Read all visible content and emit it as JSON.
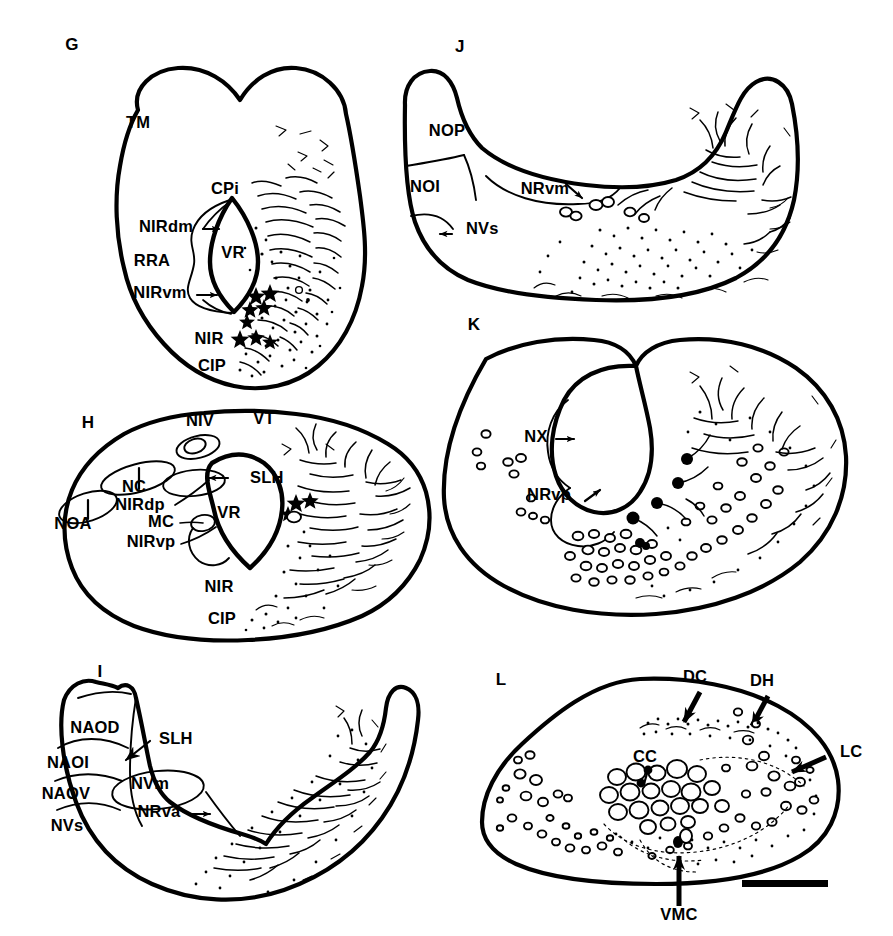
{
  "figure": {
    "background_color": "#ffffff",
    "ink_color": "#000000",
    "panel_letters": [
      "G",
      "H",
      "I",
      "J",
      "K",
      "L"
    ]
  },
  "panels": [
    {
      "letter": "G",
      "column": "left",
      "row": 1,
      "labels": [
        {
          "id": "tm",
          "text": "TM",
          "x": 138,
          "y": 128,
          "anchor": "middle",
          "leader": false
        },
        {
          "id": "cpi",
          "text": "CPi",
          "x": 225,
          "y": 194,
          "anchor": "middle",
          "leader": false
        },
        {
          "id": "nirdm",
          "text": "NIRdm",
          "x": 166,
          "y": 232,
          "anchor": "middle",
          "leader": true
        },
        {
          "id": "rra",
          "text": "RRA",
          "x": 152,
          "y": 266,
          "anchor": "middle",
          "leader": false
        },
        {
          "id": "nirvm",
          "text": "NIRvm",
          "x": 160,
          "y": 298,
          "anchor": "middle",
          "leader": true
        },
        {
          "id": "vr",
          "text": "VR",
          "x": 233,
          "y": 258,
          "anchor": "middle",
          "leader": false
        },
        {
          "id": "nir",
          "text": "NIR",
          "x": 209,
          "y": 344,
          "anchor": "middle",
          "leader": false
        },
        {
          "id": "cip",
          "text": "CIP",
          "x": 212,
          "y": 371,
          "anchor": "middle",
          "leader": false
        }
      ]
    },
    {
      "letter": "J",
      "column": "right",
      "row": 1,
      "labels": [
        {
          "id": "nop",
          "text": "NOP",
          "x": 447,
          "y": 136,
          "anchor": "middle",
          "leader": false
        },
        {
          "id": "noi",
          "text": "NOI",
          "x": 425,
          "y": 192,
          "anchor": "middle",
          "leader": false
        },
        {
          "id": "nvs",
          "text": "NVs",
          "x": 466,
          "y": 234,
          "anchor": "middle",
          "leader": true
        },
        {
          "id": "nrvm",
          "text": "NRvm",
          "x": 545,
          "y": 194,
          "anchor": "middle",
          "leader": true
        }
      ]
    },
    {
      "letter": "H",
      "column": "left",
      "row": 2,
      "labels": [
        {
          "id": "niv",
          "text": "NIV",
          "x": 200,
          "y": 426,
          "anchor": "middle",
          "leader": false
        },
        {
          "id": "vt",
          "text": "VT",
          "x": 264,
          "y": 424,
          "anchor": "middle",
          "leader": false
        },
        {
          "id": "nc",
          "text": "NC",
          "x": 134,
          "y": 492,
          "anchor": "middle",
          "leader": true
        },
        {
          "id": "noa",
          "text": "NOA",
          "x": 73,
          "y": 529,
          "anchor": "middle",
          "leader": true
        },
        {
          "id": "nirdp",
          "text": "NIRdp",
          "x": 140,
          "y": 510,
          "anchor": "middle",
          "leader": true
        },
        {
          "id": "mc",
          "text": "MC",
          "x": 161,
          "y": 527,
          "anchor": "middle",
          "leader": true
        },
        {
          "id": "nirvp",
          "text": "NIRvp",
          "x": 151,
          "y": 547,
          "anchor": "middle",
          "leader": true
        },
        {
          "id": "slh",
          "text": "SLH",
          "x": 250,
          "y": 483,
          "anchor": "middle",
          "leader": true
        },
        {
          "id": "vr",
          "text": "VR",
          "x": 229,
          "y": 518,
          "anchor": "middle",
          "leader": false
        },
        {
          "id": "nir",
          "text": "NIR",
          "x": 219,
          "y": 592,
          "anchor": "middle",
          "leader": false
        },
        {
          "id": "cip",
          "text": "CIP",
          "x": 222,
          "y": 624,
          "anchor": "middle",
          "leader": false
        }
      ]
    },
    {
      "letter": "K",
      "column": "right",
      "row": 2,
      "labels": [
        {
          "id": "nx",
          "text": "NX",
          "x": 536,
          "y": 442,
          "anchor": "middle",
          "leader": true
        },
        {
          "id": "nrvp",
          "text": "NRvp",
          "x": 549,
          "y": 500,
          "anchor": "middle",
          "leader": true
        }
      ]
    },
    {
      "letter": "I",
      "column": "left",
      "row": 3,
      "labels": [
        {
          "id": "naod",
          "text": "NAOD",
          "x": 95,
          "y": 733,
          "anchor": "middle",
          "leader": false
        },
        {
          "id": "naoi",
          "text": "NAOI",
          "x": 68,
          "y": 768,
          "anchor": "middle",
          "leader": false
        },
        {
          "id": "naov",
          "text": "NAOV",
          "x": 66,
          "y": 799,
          "anchor": "middle",
          "leader": false
        },
        {
          "id": "nvs",
          "text": "NVs",
          "x": 67,
          "y": 831,
          "anchor": "middle",
          "leader": false
        },
        {
          "id": "slh",
          "text": "SLH",
          "x": 159,
          "y": 744,
          "anchor": "middle",
          "leader": true
        },
        {
          "id": "nvm",
          "text": "NVm",
          "x": 150,
          "y": 789,
          "anchor": "middle",
          "leader": false
        },
        {
          "id": "nrva",
          "text": "NRva",
          "x": 159,
          "y": 817,
          "anchor": "middle",
          "leader": true
        }
      ]
    },
    {
      "letter": "L",
      "column": "right",
      "row": 3,
      "labels": [
        {
          "id": "dc",
          "text": "DC",
          "x": 695,
          "y": 682,
          "anchor": "middle",
          "leader": true
        },
        {
          "id": "dh",
          "text": "DH",
          "x": 762,
          "y": 686,
          "anchor": "middle",
          "leader": true
        },
        {
          "id": "lc",
          "text": "LC",
          "x": 840,
          "y": 757,
          "anchor": "middle",
          "leader": true
        },
        {
          "id": "cc",
          "text": "CC",
          "x": 645,
          "y": 762,
          "anchor": "middle",
          "leader": true
        },
        {
          "id": "vmc",
          "text": "VMC",
          "x": 679,
          "y": 920,
          "anchor": "middle",
          "leader": true
        }
      ],
      "scale_bar": {
        "present": true,
        "x": 742,
        "y": 880,
        "width": 86,
        "height": 7,
        "label": ""
      }
    }
  ],
  "panel_letter_positions": [
    {
      "letter": "G",
      "x": 72,
      "y": 50
    },
    {
      "letter": "J",
      "x": 460,
      "y": 52
    },
    {
      "letter": "H",
      "x": 88,
      "y": 428
    },
    {
      "letter": "K",
      "x": 474,
      "y": 330
    },
    {
      "letter": "I",
      "x": 100,
      "y": 677
    },
    {
      "letter": "L",
      "x": 501,
      "y": 685
    }
  ]
}
